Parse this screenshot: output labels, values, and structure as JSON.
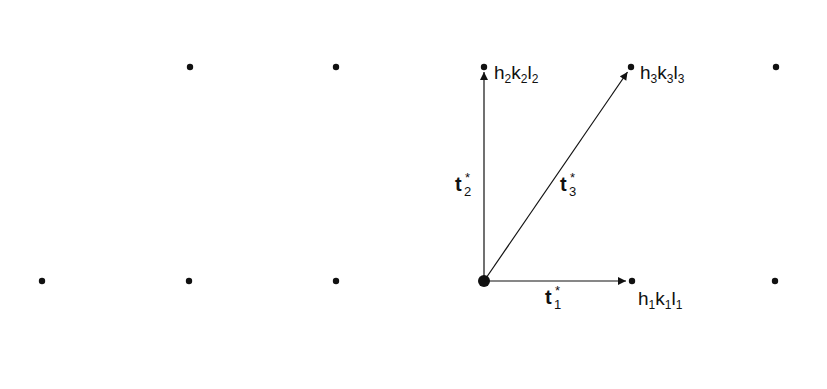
{
  "diagram": {
    "lattice_points": [
      {
        "x": 190,
        "y": 67
      },
      {
        "x": 336,
        "y": 67
      },
      {
        "x": 484,
        "y": 67,
        "label": "h2k2l2"
      },
      {
        "x": 631,
        "y": 67,
        "label": "h3k3l3"
      },
      {
        "x": 776,
        "y": 67
      },
      {
        "x": 42,
        "y": 281
      },
      {
        "x": 189,
        "y": 281
      },
      {
        "x": 336,
        "y": 281
      },
      {
        "x": 484,
        "y": 281,
        "origin": true
      },
      {
        "x": 632,
        "y": 281,
        "label": "h1k1l1"
      },
      {
        "x": 775,
        "y": 281
      }
    ],
    "vectors": [
      {
        "name": "t1*",
        "base": "t",
        "sub": "1",
        "from": [
          484,
          281
        ],
        "to": [
          632,
          281
        ]
      },
      {
        "name": "t2*",
        "base": "t",
        "sub": "2",
        "from": [
          484,
          281
        ],
        "to": [
          484,
          67
        ]
      },
      {
        "name": "t3*",
        "base": "t",
        "sub": "3",
        "from": [
          484,
          281
        ],
        "to": [
          631,
          67
        ]
      }
    ],
    "labels": {
      "p1": {
        "h": "h",
        "hs": "1",
        "k": "k",
        "ks": "1",
        "l": "l",
        "ls": "1"
      },
      "p2": {
        "h": "h",
        "hs": "2",
        "k": "k",
        "ks": "2",
        "l": "l",
        "ls": "2"
      },
      "p3": {
        "h": "h",
        "hs": "3",
        "k": "k",
        "ks": "3",
        "l": "l",
        "ls": "3"
      },
      "t1": {
        "base": "t",
        "star": "*",
        "sub": "1"
      },
      "t2": {
        "base": "t",
        "star": "*",
        "sub": "2"
      },
      "t3": {
        "base": "t",
        "star": "*",
        "sub": "3"
      }
    }
  }
}
